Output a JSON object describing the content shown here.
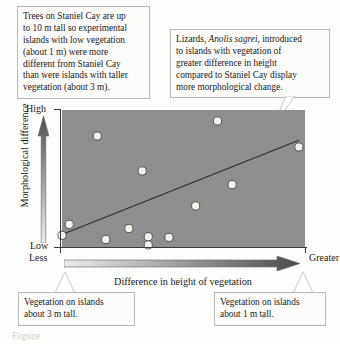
{
  "callouts": {
    "trees": {
      "lines": [
        "Trees on Staniel Cay are up",
        "to 10 m tall so experimental",
        "islands with low vegetation",
        "(about 1 m) were more",
        "different from Staniel Cay",
        "than were islands with taller",
        "vegetation (about 3 m)."
      ]
    },
    "lizards": {
      "line1_pre": "Lizards, ",
      "line1_italic": "Anolis sagrei",
      "line1_post": ", introduced",
      "lines_rest": [
        "to islands with vegetation of",
        "greater difference in height",
        "compared to Staniel Cay display",
        "more morphological change."
      ]
    },
    "veg3": {
      "lines": [
        "Vegetation on islands",
        "about 3 m tall."
      ]
    },
    "veg1": {
      "lines": [
        "Vegetation on islands",
        "about 1 m tall."
      ]
    }
  },
  "axes": {
    "y_title": "Morphological difference",
    "y_high": "High",
    "y_low": "Low",
    "x_title": "Difference in height of vegetation",
    "x_less": "Less",
    "x_greater": "Greater"
  },
  "colors": {
    "plot_fill": "#8e8e8e",
    "point_fill": "#f2f2ee",
    "point_stroke": "#4a4a4a",
    "trend_line": "#2e2e2e",
    "axis": "#3a3a3a",
    "gradient_light": "#e9e9e6",
    "gradient_dark": "#5a5a5a",
    "box_border": "#b9b9b4"
  },
  "chart_data": {
    "type": "scatter",
    "title": "",
    "xlabel": "Difference in height of vegetation",
    "ylabel": "Morphological difference",
    "xlim": [
      0,
      1
    ],
    "ylim": [
      0,
      1
    ],
    "xtick_labels": [
      "Less",
      "Greater"
    ],
    "ytick_labels": [
      "Low",
      "High"
    ],
    "grid": false,
    "legend": null,
    "n_points": 13,
    "points": [
      {
        "x": 0.0,
        "y": 0.085
      },
      {
        "x": 0.03,
        "y": 0.165
      },
      {
        "x": 0.145,
        "y": 0.81
      },
      {
        "x": 0.18,
        "y": 0.055
      },
      {
        "x": 0.275,
        "y": 0.135
      },
      {
        "x": 0.33,
        "y": 0.555
      },
      {
        "x": 0.355,
        "y": 0.075
      },
      {
        "x": 0.355,
        "y": 0.015
      },
      {
        "x": 0.44,
        "y": 0.07
      },
      {
        "x": 0.55,
        "y": 0.3
      },
      {
        "x": 0.64,
        "y": 0.92
      },
      {
        "x": 0.7,
        "y": 0.455
      },
      {
        "x": 0.975,
        "y": 0.73
      }
    ],
    "trend_line": {
      "x0": 0.005,
      "y0": 0.095,
      "x1": 0.975,
      "y1": 0.78
    }
  },
  "caption": "Figure"
}
